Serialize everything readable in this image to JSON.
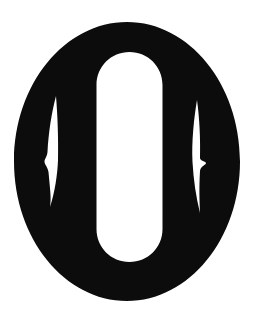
{
  "image": {
    "kind": "silhouette-illustration",
    "subject": "tsuba",
    "subject_label": "Japanese sword guard silhouette",
    "title": "",
    "caption": "",
    "width_px": 258,
    "height_px": 315,
    "background_color": "#ffffff",
    "figure_color": "#0d0c0c",
    "hole_color": "#ffffff",
    "orientation": "vertical",
    "text_present": "none"
  },
  "shapes": {
    "outer_body": {
      "name": "outer-oval-body",
      "type": "ellipse",
      "center_x": 127,
      "center_y": 161.5,
      "radius_x": 113,
      "radius_y": 139.5,
      "bounds": [
        14,
        22,
        240,
        301
      ],
      "color": "#0d0c0c"
    },
    "center_opening": {
      "name": "nakago-ana-center-opening",
      "type": "stadium",
      "center_x": 129.5,
      "center_y": 157,
      "width": 67,
      "height": 210,
      "bounds": [
        96,
        52,
        163,
        262
      ],
      "corner_radius": 33,
      "color": "#ffffff"
    },
    "left_slit": {
      "name": "left-crescent-slit",
      "type": "crescent",
      "top_tip_x": 56,
      "top_tip_y": 96,
      "bottom_tip_x": 50,
      "bottom_tip_y": 207,
      "max_width": 13,
      "widest_y": 160,
      "bounds": [
        44,
        96,
        58,
        207
      ],
      "color": "#ffffff"
    },
    "right_slit": {
      "name": "right-crescent-slit",
      "type": "crescent",
      "top_tip_x": 197,
      "top_tip_y": 100,
      "bottom_tip_x": 200,
      "bottom_tip_y": 213,
      "max_width": 12,
      "widest_y": 162,
      "bounds": [
        192,
        100,
        206,
        213
      ],
      "color": "#ffffff"
    }
  },
  "palette": {
    "ink": "#0d0c0c",
    "paper": "#ffffff"
  }
}
